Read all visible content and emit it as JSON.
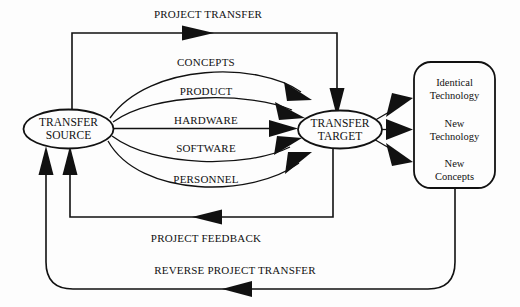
{
  "diagram": {
    "background_color": "#fdfdfd",
    "line_color": "#111111",
    "nodes": {
      "source": {
        "shape": "ellipse",
        "line1": "TRANSFER",
        "line2": "SOURCE"
      },
      "target": {
        "shape": "ellipse",
        "line1": "TRANSFER",
        "line2": "TARGET"
      },
      "outcomes": {
        "shape": "rounded-rectangle",
        "items": [
          {
            "line1": "Identical",
            "line2": "Technology"
          },
          {
            "line1": "New",
            "line2": "Technology"
          },
          {
            "line1": "New",
            "line2": "Concepts"
          }
        ]
      }
    },
    "edges": {
      "top": "PROJECT TRANSFER",
      "channels": [
        "CONCEPTS",
        "PRODUCT",
        "HARDWARE",
        "SOFTWARE",
        "PERSONNEL"
      ],
      "feedback": "PROJECT FEEDBACK",
      "reverse": "REVERSE PROJECT TRANSFER"
    }
  }
}
